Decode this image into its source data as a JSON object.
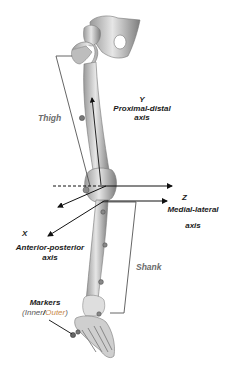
{
  "figure": {
    "segments": {
      "thigh": "Thigh",
      "shank": "Shank"
    },
    "axes": {
      "y": {
        "letter": "Y",
        "name": "Proximal-distal",
        "suffix": "axis"
      },
      "z": {
        "letter": "Z",
        "name": "Medial-lateral",
        "suffix": "axis"
      },
      "x": {
        "letter": "X",
        "name": "Anterior-posterior",
        "suffix": "axis"
      }
    },
    "markers": {
      "title": "Markers",
      "open_paren": "(",
      "inner": "Inner",
      "slash": "/",
      "outer": "Outer",
      "close_paren": ")"
    },
    "colors": {
      "bone": "#d9d9d9",
      "bone_shadow": "#8c8c8c",
      "axis_line": "#111111",
      "bracket": "#555555",
      "segment_label": "#6b6b6b",
      "outer_label": "#c98a4b"
    }
  }
}
